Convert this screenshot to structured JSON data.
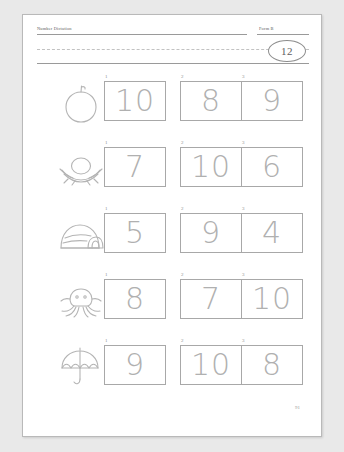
{
  "worksheet": {
    "header": {
      "title": "Number Dictation",
      "form_label": "Form B",
      "score_badge": "12"
    },
    "page_number": "91",
    "columns": [
      "1",
      "2",
      "3"
    ],
    "rows": [
      {
        "picture": "apple-icon",
        "picture_label": "apple",
        "answers": [
          {
            "index": "1",
            "value": "10"
          },
          {
            "index": "2",
            "value": "8"
          },
          {
            "index": "3",
            "value": "9"
          }
        ]
      },
      {
        "picture": "egg-nest-icon",
        "picture_label": "egg in nest",
        "answers": [
          {
            "index": "1",
            "value": "7"
          },
          {
            "index": "2",
            "value": "10"
          },
          {
            "index": "3",
            "value": "6"
          }
        ]
      },
      {
        "picture": "igloo-icon",
        "picture_label": "igloo",
        "answers": [
          {
            "index": "1",
            "value": "5"
          },
          {
            "index": "2",
            "value": "9"
          },
          {
            "index": "3",
            "value": "4"
          }
        ]
      },
      {
        "picture": "octopus-icon",
        "picture_label": "octopus",
        "answers": [
          {
            "index": "1",
            "value": "8"
          },
          {
            "index": "2",
            "value": "7"
          },
          {
            "index": "3",
            "value": "10"
          }
        ]
      },
      {
        "picture": "umbrella-icon",
        "picture_label": "umbrella",
        "answers": [
          {
            "index": "1",
            "value": "9"
          },
          {
            "index": "2",
            "value": "10"
          },
          {
            "index": "3",
            "value": "8"
          }
        ]
      }
    ]
  },
  "colors": {
    "page_background": "#e9e9e9",
    "sheet": "#ffffff",
    "rule": "#9a9a9a",
    "box_border": "#a8a8a8",
    "numeral": "#b0b0b0",
    "art_stroke": "#b4b4b4"
  }
}
